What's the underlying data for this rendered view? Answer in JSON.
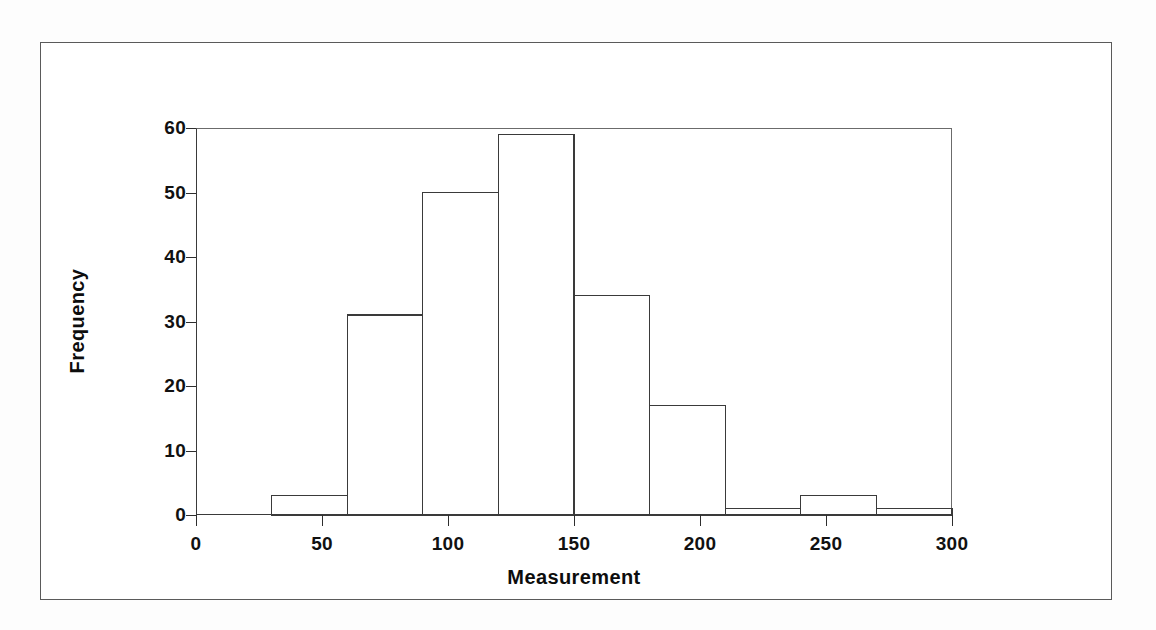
{
  "figure": {
    "background_color": "#ffffff",
    "frame_color": "#5a5a5a",
    "line_color": "#3a3a3a"
  },
  "chart_data": {
    "type": "bar",
    "title": "",
    "subtitle": "",
    "xlabel": "Measurement",
    "ylabel": "Frequency",
    "xlim": [
      0,
      300
    ],
    "ylim": [
      0,
      60
    ],
    "grid": false,
    "legend": null,
    "bin_width": 30,
    "xticks": [
      0,
      50,
      100,
      150,
      200,
      250,
      300
    ],
    "xtick_labels": [
      "0",
      "50",
      "100",
      "150",
      "200",
      "250",
      "300"
    ],
    "yticks": [
      0,
      10,
      20,
      30,
      40,
      50,
      60
    ],
    "ytick_labels": [
      "0",
      "10",
      "20",
      "30",
      "40",
      "50",
      "60"
    ],
    "bin_edges": [
      0,
      30,
      60,
      90,
      120,
      150,
      180,
      210,
      240,
      270,
      300
    ],
    "categories": [
      "0-30",
      "30-60",
      "60-90",
      "90-120",
      "120-150",
      "150-180",
      "180-210",
      "210-240",
      "240-270",
      "270-300"
    ],
    "values": [
      0,
      3,
      31,
      50,
      59,
      34,
      17,
      1,
      3,
      1
    ],
    "bar_fill": "#ffffff",
    "bar_edge": "#3a3a3a",
    "total_count": 199,
    "annotations": []
  }
}
